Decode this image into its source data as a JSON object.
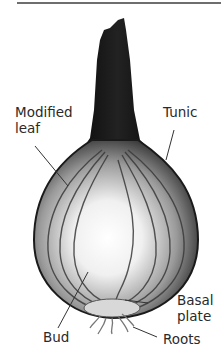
{
  "figure": {
    "labels": {
      "modified_leaf_line1": "Modified",
      "modified_leaf_line2": "leaf",
      "tunic": "Tunic",
      "basal_plate_line1": "Basal",
      "basal_plate_line2": "plate",
      "bud": "Bud",
      "roots": "Roots"
    },
    "colors": {
      "label_text": "#2a2a2a",
      "leader_line": "#333333",
      "top_rule": "#6e6e6e",
      "tunic_dark": "#111111",
      "flesh_light": "#f4f4f4"
    }
  }
}
